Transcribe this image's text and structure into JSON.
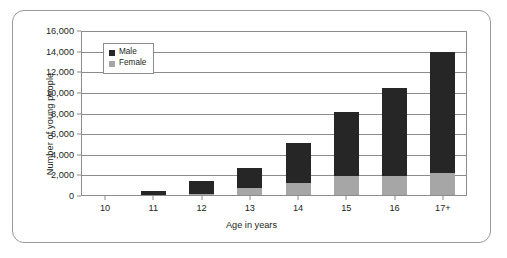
{
  "chart_data": {
    "type": "bar",
    "subtype": "stacked-bar",
    "title": "",
    "xlabel": "Age in years",
    "ylabel": "Number of young people",
    "categories": [
      "10",
      "11",
      "12",
      "13",
      "14",
      "15",
      "16",
      "17+"
    ],
    "series": [
      {
        "name": "Female",
        "color": "#a6a6a6",
        "values": [
          50,
          100,
          150,
          800,
          1250,
          1900,
          1950,
          2200
        ]
      },
      {
        "name": "Male",
        "color": "#262626",
        "values": [
          50,
          350,
          1350,
          1950,
          3850,
          6200,
          8550,
          11800
        ]
      }
    ],
    "totals": [
      100,
      450,
      1500,
      2750,
      5100,
      8100,
      10500,
      14000
    ],
    "ylim": [
      0,
      16000
    ],
    "ytick_values": [
      0,
      2000,
      4000,
      6000,
      8000,
      10000,
      12000,
      14000,
      16000
    ],
    "ytick_labels": [
      "0",
      "2,000",
      "4,000",
      "6,000",
      "8,000",
      "10,000",
      "12,000",
      "14,000",
      "16,000"
    ],
    "grid": true,
    "grid_axis": "y",
    "legend_position": "top-left-inside",
    "legend_entries": [
      {
        "label": "Male",
        "color": "#262626"
      },
      {
        "label": "Female",
        "color": "#a6a6a6"
      }
    ]
  },
  "axes": {
    "y_title": "Number of young people",
    "x_title": "Age in years"
  },
  "colors": {
    "male": "#262626",
    "female": "#a6a6a6",
    "axis": "#8c8c8c",
    "frame": "#9a9a9a",
    "text": "#231f20"
  }
}
